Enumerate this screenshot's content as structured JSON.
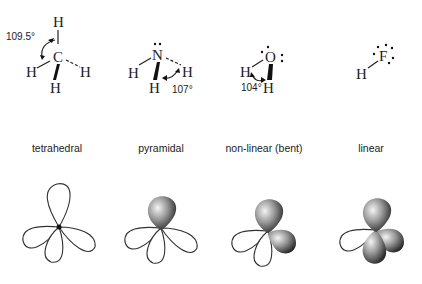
{
  "molecules": [
    {
      "formula": "CH4",
      "central": "C",
      "atoms": [
        "H",
        "H",
        "H",
        "H"
      ],
      "angle": "109.5°",
      "shape": "tetrahedral",
      "lone_pairs": 0
    },
    {
      "formula": "NH3",
      "central": "N",
      "atoms": [
        "H",
        "H",
        "H"
      ],
      "angle": "107°",
      "shape": "pyramidal",
      "lone_pairs": 1
    },
    {
      "formula": "H2O",
      "central": "O",
      "atoms": [
        "H",
        "H"
      ],
      "angle": "104°",
      "shape": "non-linear (bent)",
      "lone_pairs": 2
    },
    {
      "formula": "HF",
      "central": "F",
      "atoms": [
        "H"
      ],
      "angle": "",
      "shape": "linear",
      "lone_pairs": 3
    }
  ],
  "colors": {
    "ink": "#222222",
    "lone_pair_dark": "#222222",
    "lone_pair_light": "#f0f0f0"
  }
}
